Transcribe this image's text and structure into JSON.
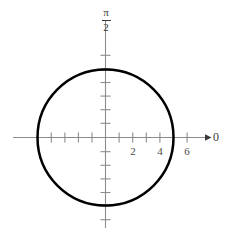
{
  "chart_data": {
    "type": "line",
    "title": "",
    "subtitle": "",
    "plot_kind": "polar-circle",
    "curve": {
      "name": "r = 5",
      "shape": "circle",
      "center_polar": {
        "r": 0,
        "theta": 0
      },
      "radius": 5,
      "closed": true,
      "line_color": "#000000",
      "line_width_px": 2.5,
      "points_polar": [
        {
          "theta_deg": 0,
          "r": 5
        },
        {
          "theta_deg": 30,
          "r": 5
        },
        {
          "theta_deg": 60,
          "r": 5
        },
        {
          "theta_deg": 90,
          "r": 5
        },
        {
          "theta_deg": 120,
          "r": 5
        },
        {
          "theta_deg": 150,
          "r": 5
        },
        {
          "theta_deg": 180,
          "r": 5
        },
        {
          "theta_deg": 210,
          "r": 5
        },
        {
          "theta_deg": 240,
          "r": 5
        },
        {
          "theta_deg": 270,
          "r": 5
        },
        {
          "theta_deg": 300,
          "r": 5
        },
        {
          "theta_deg": 330,
          "r": 5
        },
        {
          "theta_deg": 360,
          "r": 5
        }
      ]
    },
    "xlabel": "0",
    "ylabel": "π/2",
    "y_axis_label_parts": {
      "numerator": "π",
      "denominator": "2"
    },
    "xlim": [
      -6.8,
      7.2
    ],
    "ylim": [
      -7.0,
      6.6
    ],
    "grid": false,
    "legend": false,
    "legend_position": "none",
    "axis_color": "#8c8c8c",
    "label_color": "#4a4a4a",
    "x_ticks": [
      -5,
      -4,
      -3,
      -2,
      -1,
      1,
      2,
      3,
      4,
      5,
      6
    ],
    "x_tick_labels": [
      {
        "value": 2,
        "text": "2"
      },
      {
        "value": 4,
        "text": "4"
      },
      {
        "value": 6,
        "text": "6"
      }
    ],
    "y_ticks": [
      -6,
      -5,
      -4,
      -3,
      -2,
      -1,
      1,
      2,
      3,
      4,
      5,
      6
    ],
    "y_tick_labels": [],
    "arrow_on_x_axis": true,
    "arrow_on_y_axis": false
  },
  "labels": {
    "angle_axis": "0",
    "pi": "π",
    "two": "2",
    "x_2": "2",
    "x_4": "4",
    "x_6": "6"
  }
}
